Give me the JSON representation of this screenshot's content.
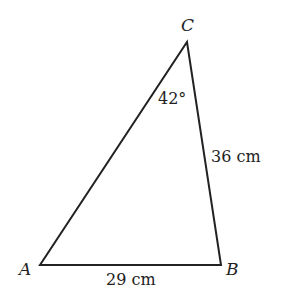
{
  "diagram": {
    "type": "triangle",
    "vertices": {
      "A": {
        "label": "A"
      },
      "B": {
        "label": "B"
      },
      "C": {
        "label": "C"
      }
    },
    "angle_C": {
      "label": "42°"
    },
    "side_BC": {
      "label": "36 cm"
    },
    "side_AB": {
      "label": "29 cm"
    },
    "stroke_color": "#222222"
  }
}
